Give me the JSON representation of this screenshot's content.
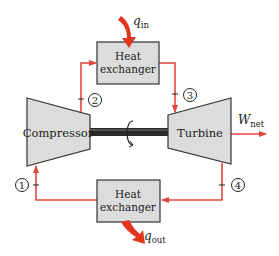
{
  "diagram": {
    "type": "gas-turbine-cycle (Brayton)",
    "colors": {
      "flow_line": "#e0463a",
      "heat_arrow": "#e2361f",
      "component_fill": "#dcdcdc",
      "component_stroke": "#333333",
      "shaft": "#222222"
    },
    "components": {
      "heat_exchanger_top": {
        "line1": "Heat",
        "line2": "exchanger"
      },
      "heat_exchanger_bottom": {
        "line1": "Heat",
        "line2": "exchanger"
      },
      "compressor": {
        "label": "Compressor"
      },
      "turbine": {
        "label": "Turbine"
      }
    },
    "heat_labels": {
      "q_in": {
        "base": "q",
        "sub": "in"
      },
      "q_out": {
        "base": "q",
        "sub": "out"
      }
    },
    "work_label": {
      "base": "W",
      "sub": "net"
    },
    "states": [
      "1",
      "2",
      "3",
      "4"
    ]
  }
}
